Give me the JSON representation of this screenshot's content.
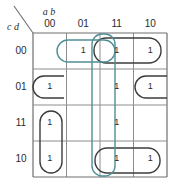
{
  "diagram": {
    "kind": "karnaugh-map",
    "title": "",
    "axis": {
      "top_variables": "a b",
      "left_variables": "c d",
      "column_headers": [
        "00",
        "01",
        "11",
        "10"
      ],
      "row_headers": [
        "00",
        "01",
        "11",
        "10"
      ]
    },
    "geometry": {
      "grid_left": 33,
      "grid_top": 33,
      "cell_width": 33.5,
      "cell_height": 36,
      "columns": 4,
      "rows": 4
    },
    "colors": {
      "grid_line": "#8d8d8d",
      "grid_border": "#6e6e6e",
      "group_black": "#3c3c3c",
      "group_teal": "#4f8f96",
      "text": "#2b2b2b",
      "background": "#ffffff"
    },
    "cell_value_one": "1",
    "cells": [
      {
        "row": 0,
        "col": 0,
        "value": ""
      },
      {
        "row": 0,
        "col": 1,
        "value": "1"
      },
      {
        "row": 0,
        "col": 2,
        "value": "1"
      },
      {
        "row": 0,
        "col": 3,
        "value": "1"
      },
      {
        "row": 1,
        "col": 0,
        "value": "1"
      },
      {
        "row": 1,
        "col": 1,
        "value": ""
      },
      {
        "row": 1,
        "col": 2,
        "value": "1"
      },
      {
        "row": 1,
        "col": 3,
        "value": "1"
      },
      {
        "row": 2,
        "col": 0,
        "value": "1"
      },
      {
        "row": 2,
        "col": 1,
        "value": ""
      },
      {
        "row": 2,
        "col": 2,
        "value": "1"
      },
      {
        "row": 2,
        "col": 3,
        "value": ""
      },
      {
        "row": 3,
        "col": 0,
        "value": "1"
      },
      {
        "row": 3,
        "col": 1,
        "value": ""
      },
      {
        "row": 3,
        "col": 2,
        "value": "1"
      },
      {
        "row": 3,
        "col": 3,
        "value": "1"
      }
    ],
    "groups": [
      {
        "id": "group-teal-row0-c1c2",
        "color": "teal",
        "shape": "rounded-rect",
        "cells": [
          [
            0,
            1
          ],
          [
            0,
            2
          ]
        ],
        "x": 57,
        "y": 40,
        "w": 58,
        "h": 22,
        "r": 11
      },
      {
        "id": "group-teal-col2-all",
        "color": "teal",
        "shape": "rounded-rect",
        "cells": [
          [
            0,
            2
          ],
          [
            1,
            2
          ],
          [
            2,
            2
          ],
          [
            3,
            2
          ]
        ],
        "x": 92,
        "y": 34,
        "w": 23,
        "h": 142,
        "r": 10
      },
      {
        "id": "group-black-row0-c2c3",
        "color": "black",
        "shape": "rounded-rect",
        "cells": [
          [
            0,
            2
          ],
          [
            0,
            3
          ]
        ],
        "x": 94,
        "y": 38,
        "w": 67,
        "h": 25,
        "r": 12
      },
      {
        "id": "group-black-row1-c0-wrap",
        "color": "black",
        "shape": "open-left",
        "cells": [
          [
            1,
            0
          ]
        ],
        "x": 33,
        "y": 76,
        "w": 31,
        "h": 22,
        "r": 11
      },
      {
        "id": "group-black-row1-c3-wrap",
        "color": "black",
        "shape": "open-right",
        "cells": [
          [
            1,
            3
          ]
        ],
        "x": 135,
        "y": 76,
        "w": 32,
        "h": 22,
        "r": 11
      },
      {
        "id": "group-black-col0-r2r3",
        "color": "black",
        "shape": "rounded-rect",
        "cells": [
          [
            2,
            0
          ],
          [
            3,
            0
          ]
        ],
        "x": 40,
        "y": 111,
        "w": 22,
        "h": 62,
        "r": 11
      },
      {
        "id": "group-black-row3-c2c3",
        "color": "black",
        "shape": "rounded-rect",
        "cells": [
          [
            3,
            2
          ],
          [
            3,
            3
          ]
        ],
        "x": 95,
        "y": 148,
        "w": 65,
        "h": 25,
        "r": 12
      }
    ]
  }
}
